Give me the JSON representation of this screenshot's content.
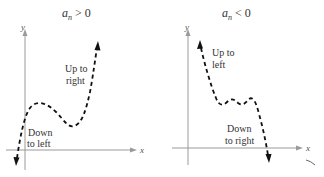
{
  "figure": {
    "panels": [
      {
        "id": "positive",
        "title": {
          "variable": "a",
          "subscript": "n",
          "operator": ">",
          "value": "0"
        },
        "axes": {
          "x_label": "x",
          "y_label": "y"
        },
        "annotations": [
          {
            "line1": "Up to",
            "line2": "right"
          },
          {
            "line1": "Down",
            "line2": "to left"
          }
        ],
        "end_behavior": {
          "left": "down",
          "right": "up"
        }
      },
      {
        "id": "negative",
        "title": {
          "variable": "a",
          "subscript": "n",
          "operator": "<",
          "value": "0"
        },
        "axes": {
          "x_label": "x",
          "y_label": "y"
        },
        "annotations": [
          {
            "line1": "Up to",
            "line2": "left"
          },
          {
            "line1": "Down",
            "line2": "to right"
          }
        ],
        "end_behavior": {
          "left": "up",
          "right": "down"
        }
      }
    ],
    "colors": {
      "curve": "#111111",
      "axis": "#9a9a9a",
      "text": "#333333"
    }
  }
}
